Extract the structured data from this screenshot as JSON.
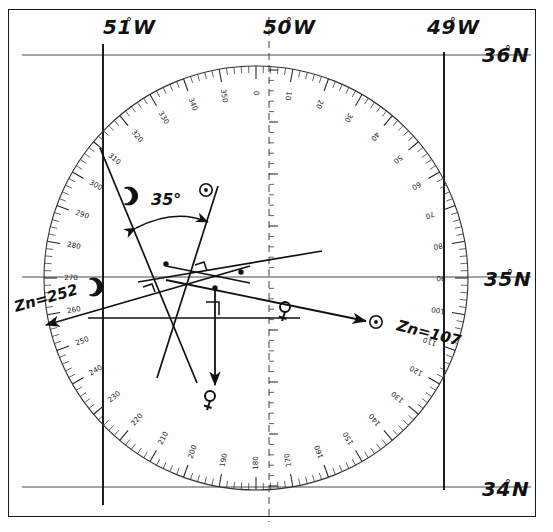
{
  "document": {
    "type": "celestial-navigation-plotting-sheet",
    "title": "Hand-drawn celestial fix plotting sheet"
  },
  "grid": {
    "longitude_labels": [
      {
        "text": "51",
        "deg": "°",
        "suffix": "W",
        "x": 103,
        "y": 34
      },
      {
        "text": "50",
        "deg": "°",
        "suffix": "W",
        "x": 263,
        "y": 34
      },
      {
        "text": "49",
        "deg": "°",
        "suffix": "W",
        "x": 427,
        "y": 34
      }
    ],
    "latitude_labels": [
      {
        "text": "36",
        "deg": "°",
        "suffix": "N",
        "x": 482,
        "y": 62
      },
      {
        "text": "35",
        "deg": "°",
        "suffix": "N",
        "x": 484,
        "y": 286
      },
      {
        "text": "34",
        "deg": "°",
        "suffix": "N",
        "x": 482,
        "y": 496
      }
    ],
    "meridian_x": [
      103,
      269,
      444
    ],
    "parallel_y": [
      55,
      277,
      487
    ],
    "color": "#4a4a4a"
  },
  "compass_rose": {
    "center_x": 256,
    "center_y": 278,
    "radius": 212,
    "zero_at": "top",
    "direction": "clockwise",
    "major_interval": 10,
    "minor_interval": 2,
    "labels": [
      0,
      10,
      20,
      30,
      40,
      50,
      60,
      70,
      80,
      90,
      100,
      110,
      120,
      130,
      140,
      150,
      160,
      170,
      180,
      190,
      200,
      210,
      220,
      230,
      240,
      250,
      260,
      270,
      280,
      290,
      300,
      310,
      320,
      330,
      340,
      350
    ]
  },
  "annotations": {
    "moon_azimuth": {
      "label": "Zn=252",
      "x": 16,
      "y": 312,
      "rotate": -16,
      "body": "moon",
      "value": 252
    },
    "sun_azimuth": {
      "label": "Zn=107",
      "x": 396,
      "y": 330,
      "rotate": 14,
      "body": "sun",
      "value": 107
    },
    "angle_between": {
      "label": "35°",
      "x": 151,
      "y": 205,
      "value": 35
    }
  },
  "body_glyphs": [
    {
      "name": "moon-glyph-top",
      "symbol": "moon",
      "x": 128,
      "y": 196
    },
    {
      "name": "moon-glyph-left",
      "symbol": "moon",
      "x": 93,
      "y": 287
    },
    {
      "name": "sun-glyph-top",
      "symbol": "sun",
      "x": 206,
      "y": 190
    },
    {
      "name": "sun-glyph-right",
      "symbol": "sun",
      "x": 376,
      "y": 322
    },
    {
      "name": "venus-glyph-bottom",
      "symbol": "venus",
      "x": 210,
      "y": 400
    },
    {
      "name": "venus-glyph-center",
      "symbol": "venus",
      "x": 285,
      "y": 311
    }
  ],
  "lines_of_position": [
    {
      "name": "moon-lop",
      "body": "moon",
      "x1": 100,
      "y1": 148,
      "x2": 197,
      "y2": 383
    },
    {
      "name": "sun-lop",
      "body": "sun",
      "x1": 218,
      "y1": 186,
      "x2": 157,
      "y2": 378
    },
    {
      "name": "venus-lop",
      "body": "venus",
      "x1": 88,
      "y1": 318,
      "x2": 300,
      "y2": 318
    },
    {
      "name": "moon-azimuth-ray",
      "body": "moon",
      "x1": 248,
      "y1": 265,
      "x2": 41,
      "y2": 325
    },
    {
      "name": "sun-azimuth-ray",
      "body": "sun",
      "x1": 166,
      "y1": 280,
      "x2": 366,
      "y2": 321
    },
    {
      "name": "venus-azimuth-ray",
      "body": "venus",
      "x1": 215,
      "y1": 286,
      "x2": 215,
      "y2": 382
    }
  ]
}
